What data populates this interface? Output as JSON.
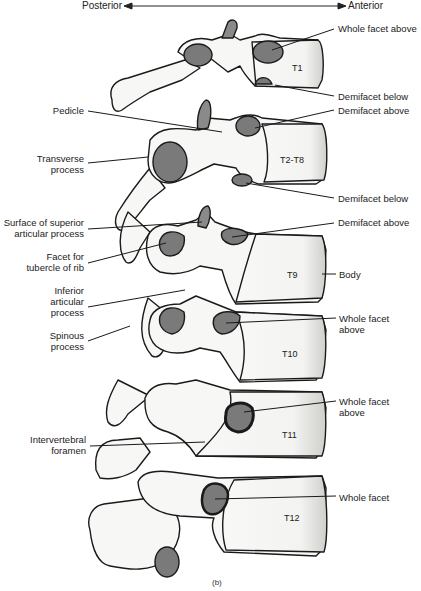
{
  "orientation": {
    "left": "Posterior",
    "right": "Anterior"
  },
  "vertebrae": [
    {
      "id": "T1",
      "label": "T1"
    },
    {
      "id": "T2-T8",
      "label": "T2-T8"
    },
    {
      "id": "T9",
      "label": "T9"
    },
    {
      "id": "T10",
      "label": "T10"
    },
    {
      "id": "T11",
      "label": "T11"
    },
    {
      "id": "T12",
      "label": "T12"
    }
  ],
  "labels_right": [
    {
      "text": "Whole facet above",
      "target": "T1"
    },
    {
      "text": "Demifacet below",
      "target": "T1"
    },
    {
      "text": "Demifacet above",
      "target": "T2-T8"
    },
    {
      "text": "Demifacet below",
      "target": "T2-T8"
    },
    {
      "text": "Demifacet above",
      "target": "T9"
    },
    {
      "text": "Body",
      "target": "T9"
    },
    {
      "text": "Whole facet\nabove",
      "target": "T10"
    },
    {
      "text": "Whole facet\nabove",
      "target": "T11"
    },
    {
      "text": "Whole facet",
      "target": "T12"
    }
  ],
  "labels_left": [
    {
      "text": "Pedicle"
    },
    {
      "text": "Transverse\nprocess"
    },
    {
      "text": "Surface of superior\narticular process"
    },
    {
      "text": "Facet for\ntubercle of rib"
    },
    {
      "text": "Inferior\narticular\nprocess"
    },
    {
      "text": "Spinous\nprocess"
    },
    {
      "text": "Intervertebral\nforamen"
    }
  ],
  "caption": "(b)",
  "colors": {
    "bone_fill": "#f7f7f5",
    "outline": "#1a1a1a",
    "facet": "#7a7a7a",
    "shade": "#c8c8c6"
  }
}
